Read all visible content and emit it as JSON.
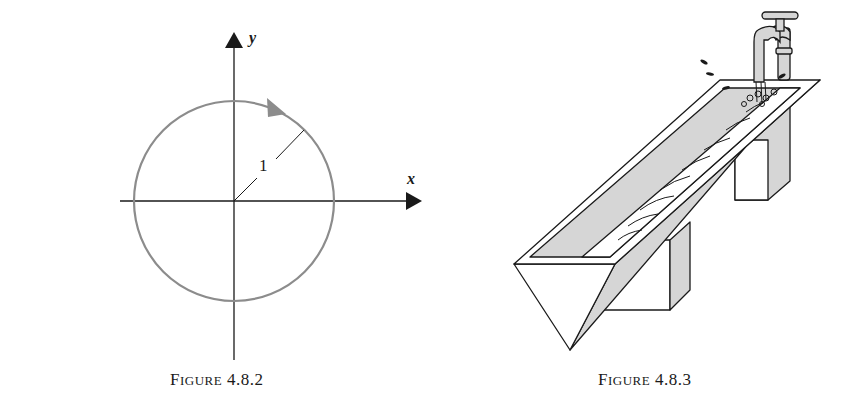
{
  "figures": [
    {
      "id": "4.8.2",
      "caption": {
        "first": "F",
        "rest": "igure",
        "number": "4.8.2"
      },
      "axes": {
        "x_label": "x",
        "y_label": "y"
      },
      "circle": {
        "radius_label": "1",
        "orientation": "clockwise",
        "stroke_color": "#8c8c8c"
      }
    },
    {
      "id": "4.8.3",
      "caption": {
        "first": "F",
        "rest": "igure",
        "number": "4.8.3"
      },
      "description": "Trough with triangular cross-section being filled by a faucet",
      "fill_color": "#d6d6d6"
    }
  ]
}
